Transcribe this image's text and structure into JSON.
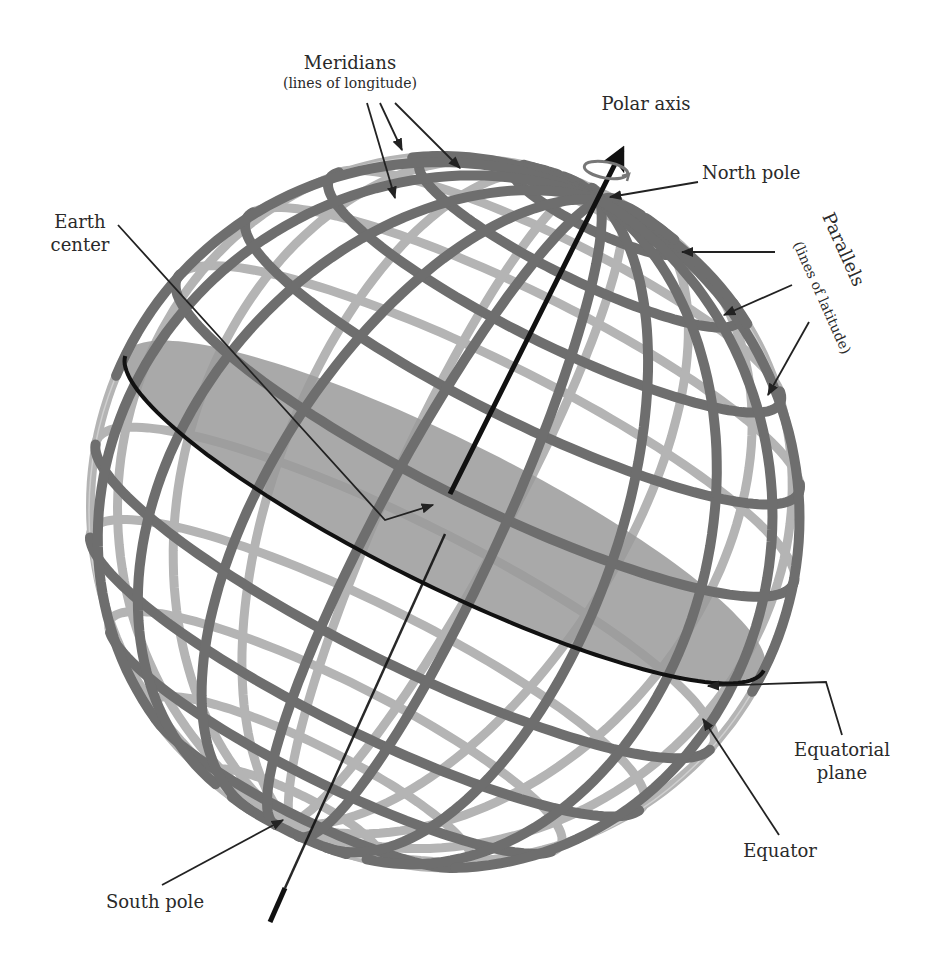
{
  "figure": {
    "type": "earth-coordinate-diagram"
  },
  "labels": {
    "meridians": {
      "title": "Meridians",
      "subtitle": "(lines of longitude)"
    },
    "polar_axis": "Polar axis",
    "north_pole": "North pole",
    "parallels": {
      "title": "Parallels",
      "subtitle": "(lines of latitude)"
    },
    "earth_center": {
      "line1": "Earth",
      "line2": "center"
    },
    "equatorial_plane": {
      "line1": "Equatorial",
      "line2": "plane"
    },
    "equator": "Equator",
    "south_pole": "South pole"
  },
  "colors": {
    "front_band": "#6e6e6e",
    "back_band": "#b4b4b4",
    "equatorial_plane": "#9a9a9a",
    "equator_line": "#111111",
    "axis": "#111111",
    "text": "#2a2a2a",
    "leader": "#222222"
  },
  "globe": {
    "center": [
      445,
      512
    ],
    "radius": 356,
    "tilt_deg": 24,
    "meridian_count": 18,
    "parallels_deg": [
      -75,
      -60,
      -45,
      -30,
      -15,
      15,
      30,
      45,
      60,
      75
    ]
  }
}
